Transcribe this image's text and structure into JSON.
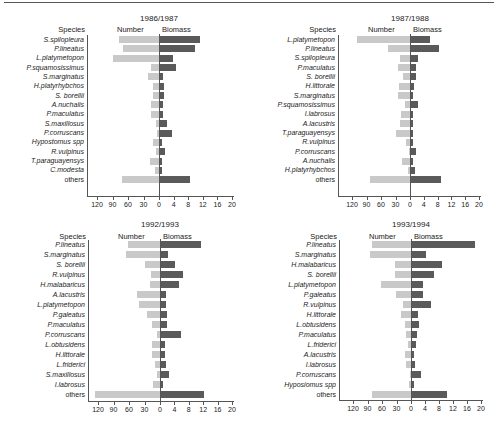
{
  "chart_data": [
    {
      "type": "bar",
      "title": "1986/1987",
      "orientation": "horizontal-diverging",
      "ylabel": "Species",
      "series_labels": [
        "Number",
        "Biomass"
      ],
      "number_ticks": [
        "120",
        "90",
        "60",
        "30",
        "0"
      ],
      "biomass_ticks": [
        "4",
        "8",
        "12",
        "16",
        "20"
      ],
      "categories": [
        "S.spilopleura",
        "P.lineatus",
        "L.platymetopon",
        "P.squamosissimus",
        "S.marginatus",
        "H.platyrhybchos",
        "S. borellii",
        "A.nuchalis",
        "P.maculatus",
        "S.maxillosus",
        "P.corruscans",
        "Hypostomus spp",
        "R.vulpinus",
        "T.paraguayensys",
        "C.modesta",
        "others"
      ],
      "series": [
        {
          "name": "Number",
          "values": [
            78,
            70,
            90,
            15,
            22,
            12,
            12,
            15,
            15,
            5,
            3,
            12,
            5,
            18,
            7,
            72
          ]
        },
        {
          "name": "Biomass",
          "values": [
            11,
            9.5,
            3.5,
            4.5,
            0.7,
            1.2,
            1.2,
            0.8,
            0.8,
            2,
            3.2,
            0.6,
            1.4,
            0.6,
            0.6,
            8.2
          ]
        }
      ],
      "xlim_number": [
        0,
        120
      ],
      "xlim_biomass": [
        0,
        20
      ]
    },
    {
      "type": "bar",
      "title": "1987/1988",
      "orientation": "horizontal-diverging",
      "ylabel": "Species",
      "series_labels": [
        "Number",
        "Biomass"
      ],
      "number_ticks": [
        "120",
        "90",
        "60",
        "30",
        "0"
      ],
      "biomass_ticks": [
        "4",
        "8",
        "12",
        "16",
        "20"
      ],
      "categories": [
        "L.platymetopon",
        "P.lineatus",
        "S.spilopleura",
        "P.maculatus",
        "S. borellii",
        "H.littorale",
        "S.marginatus",
        "P.squamosissimus",
        "I.labrosus",
        "A.lacustris",
        "T.paraguayensys",
        "R.vulpinus",
        "P.corruscans",
        "A.nuchalis",
        "H.platyrhybchos",
        "others"
      ],
      "series": [
        {
          "name": "Number",
          "values": [
            110,
            45,
            20,
            25,
            15,
            22,
            25,
            10,
            18,
            20,
            28,
            8,
            3,
            16,
            5,
            83
          ]
        },
        {
          "name": "Biomass",
          "values": [
            5.5,
            8,
            2,
            1.5,
            1.5,
            1,
            0.5,
            2,
            0.6,
            0.6,
            0.5,
            0.6,
            1.5,
            0.5,
            1.2,
            8.8
          ]
        }
      ],
      "xlim_number": [
        0,
        120
      ],
      "xlim_biomass": [
        0,
        20
      ]
    },
    {
      "type": "bar",
      "title": "1992/1993",
      "orientation": "horizontal-diverging",
      "ylabel": "Species",
      "series_labels": [
        "Number",
        "Biomass"
      ],
      "number_ticks": [
        "120",
        "90",
        "60",
        "30",
        "0"
      ],
      "biomass_ticks": [
        "4",
        "8",
        "12",
        "16",
        "20"
      ],
      "categories": [
        "P.lineatus",
        "S.marginatus",
        "S. borellii",
        "R.vulpinus",
        "H.malabaricus",
        "A.lacustris",
        "L.platymetopon",
        "P.galeatus",
        "P.maculatus",
        "P.corruscans",
        "L.obtusidens",
        "H.littorale",
        "L.friderici",
        "S.maxillosus",
        "I.labrosus",
        "others"
      ],
      "series": [
        {
          "name": "Number",
          "values": [
            62,
            65,
            30,
            18,
            20,
            45,
            40,
            25,
            16,
            5,
            16,
            15,
            10,
            5,
            14,
            125
          ]
        },
        {
          "name": "Biomass",
          "values": [
            11,
            2,
            4,
            6,
            5,
            1.5,
            1.5,
            1.6,
            1.8,
            5.5,
            1,
            1,
            1.3,
            2.2,
            0.5,
            12
          ]
        }
      ],
      "xlim_number": [
        0,
        120
      ],
      "xlim_biomass": [
        0,
        20
      ]
    },
    {
      "type": "bar",
      "title": "1993/1994",
      "orientation": "horizontal-diverging",
      "ylabel": "Species",
      "series_labels": [
        "Number",
        "Biomass"
      ],
      "number_ticks": [
        "120",
        "90",
        "60",
        "30",
        "0"
      ],
      "biomass_ticks": [
        "4",
        "8",
        "12",
        "16",
        "20"
      ],
      "categories": [
        "P.lineatus",
        "S.marginatus",
        "H.malabaricus",
        "S. borellii",
        "L.platymetopon",
        "P.galeatus",
        "R.vulpinus",
        "H.littorale",
        "L.obtusidens",
        "P.maculatus",
        "L.friderici",
        "A.lacustris",
        "I.labrosus",
        "P.corruscans",
        "Hyposiomus spp",
        "others"
      ],
      "series": [
        {
          "name": "Number",
          "values": [
            80,
            85,
            33,
            33,
            62,
            32,
            16,
            20,
            12,
            10,
            7,
            13,
            10,
            3,
            5,
            80
          ]
        },
        {
          "name": "Biomass",
          "values": [
            18,
            4,
            8.5,
            6.2,
            3.2,
            3,
            5.5,
            1.8,
            2,
            1.5,
            1.2,
            0.7,
            0.8,
            2.5,
            0.7,
            10
          ]
        }
      ],
      "xlim_number": [
        0,
        120
      ],
      "xlim_biomass": [
        0,
        20
      ]
    }
  ],
  "labels": {
    "species": "Species",
    "number": "Number",
    "biomass": "Biomass"
  }
}
